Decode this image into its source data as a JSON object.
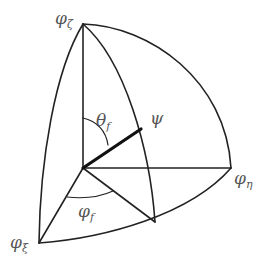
{
  "diagram": {
    "type": "spherical-octant",
    "colors": {
      "line": "#222222",
      "label": "#555555",
      "background": "#ffffff"
    },
    "labels": {
      "phi_zeta": {
        "main": "φ",
        "sub": "ζ"
      },
      "phi_eta": {
        "main": "φ",
        "sub": "η"
      },
      "phi_xi": {
        "main": "φ",
        "sub": "ξ"
      },
      "theta_f": {
        "main": "θ",
        "sub": "f"
      },
      "varphi_f": {
        "main": "φ",
        "sub": "f"
      },
      "psi": {
        "main": "ψ",
        "sub": ""
      }
    },
    "nodes": {
      "origin": [
        83,
        168
      ],
      "zeta_axis_tip": [
        83,
        24
      ],
      "eta_axis_tip": [
        231,
        168
      ],
      "xi_axis_tip": [
        39,
        243
      ],
      "psi_tip": [
        141,
        129
      ],
      "meridian_foot": [
        155,
        222
      ]
    }
  }
}
